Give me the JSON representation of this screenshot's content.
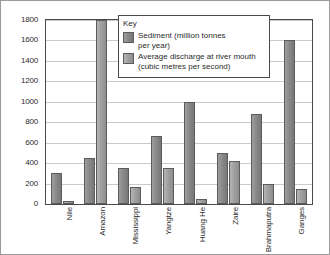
{
  "chart_data": {
    "type": "bar",
    "title": "",
    "xlabel": "",
    "ylabel": "",
    "categories": [
      "Nile",
      "Amazon",
      "Mississippi",
      "Yangtze",
      "Huang He",
      "Zaire",
      "Brahmaputra",
      "Ganges"
    ],
    "series": [
      {
        "name": "Sediment (million tonnes per year)",
        "values": [
          300,
          450,
          350,
          670,
          1000,
          500,
          880,
          1600
        ]
      },
      {
        "name": "Average discharge at river mouth (cubic metres per second)",
        "values": [
          30,
          1800,
          170,
          350,
          50,
          420,
          200,
          150
        ]
      }
    ],
    "ylim": [
      0,
      1800
    ],
    "ytick_step": 200,
    "yticks": [
      "1800",
      "1600",
      "1400",
      "1200",
      "1000",
      "800",
      "600",
      "400",
      "200",
      "0"
    ],
    "grid": true,
    "legend_position": "top-center",
    "colors": {
      "sediment": "#8a8a8a",
      "discharge": "#a0a0a0",
      "gridline": "#c9c9c9",
      "axis": "#4a4a4a",
      "text": "#2b2b2b"
    }
  },
  "legend": {
    "title": "Key",
    "entries": [
      {
        "line1": "Sediment (million tonnes",
        "line2": "per year)"
      },
      {
        "line1": "Average discharge at river mouth",
        "line2": "(cubic metres per second)"
      }
    ]
  }
}
